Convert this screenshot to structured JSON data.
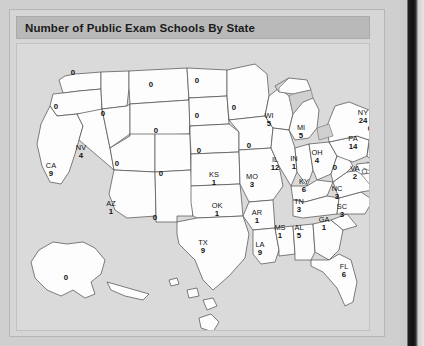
{
  "figure": {
    "title": "Number of Public Exam Schools By State",
    "panel_background": "#dadada",
    "title_bar_background": "#b9b9b9",
    "state_fill": "#fdfdfd",
    "state_border": "#4a4a4a",
    "water_fill": "#d0d0d0"
  },
  "chart_data": {
    "type": "map",
    "title": "Number of Public Exam Schools By State",
    "subtitle": "",
    "xlabel": "",
    "ylabel": "",
    "region_type": "us-states",
    "value_label": "Number of Public Exam Schools",
    "legend": "none",
    "categories": [
      "WA",
      "OR",
      "CA",
      "NV",
      "ID",
      "MT",
      "WY",
      "UT",
      "AZ",
      "CO",
      "NM",
      "ND",
      "SD",
      "NE",
      "KS",
      "OK",
      "TX",
      "MN",
      "IA",
      "MO",
      "AR",
      "LA",
      "WI",
      "IL",
      "MS",
      "AL",
      "MI",
      "IN",
      "OH",
      "KY",
      "TN",
      "GA",
      "FL",
      "SC",
      "NC",
      "VA",
      "WV",
      "PA",
      "NY",
      "ME",
      "VT",
      "NH",
      "MA",
      "RI",
      "CT",
      "NJ",
      "DE",
      "MD",
      "DC",
      "AK",
      "HI"
    ],
    "values": [
      0,
      0,
      9,
      4,
      0,
      0,
      0,
      0,
      1,
      0,
      0,
      0,
      0,
      0,
      1,
      1,
      9,
      0,
      0,
      3,
      1,
      9,
      5,
      12,
      1,
      5,
      5,
      1,
      4,
      6,
      3,
      1,
      6,
      3,
      3,
      2,
      0,
      14,
      24,
      1,
      0,
      0,
      4,
      1,
      0,
      16,
      1,
      5,
      4,
      0,
      0
    ],
    "states": [
      {
        "code": "WA",
        "value": "0",
        "show_code": false,
        "x": 62,
        "y": 63
      },
      {
        "code": "OR",
        "value": "0",
        "show_code": false,
        "x": 45,
        "y": 97
      },
      {
        "code": "CA",
        "value": "9",
        "show_code": true,
        "x": 40,
        "y": 160
      },
      {
        "code": "NV",
        "value": "4",
        "show_code": true,
        "x": 70,
        "y": 142
      },
      {
        "code": "ID",
        "value": "0",
        "show_code": false,
        "x": 92,
        "y": 104
      },
      {
        "code": "MT",
        "value": "0",
        "show_code": false,
        "x": 140,
        "y": 75
      },
      {
        "code": "WY",
        "value": "0",
        "show_code": false,
        "x": 145,
        "y": 121
      },
      {
        "code": "UT",
        "value": "0",
        "show_code": false,
        "x": 106,
        "y": 154
      },
      {
        "code": "AZ",
        "value": "1",
        "show_code": true,
        "x": 100,
        "y": 198
      },
      {
        "code": "CO",
        "value": "0",
        "show_code": false,
        "x": 150,
        "y": 164
      },
      {
        "code": "NM",
        "value": "0",
        "show_code": false,
        "x": 144,
        "y": 208
      },
      {
        "code": "ND",
        "value": "0",
        "show_code": false,
        "x": 186,
        "y": 71
      },
      {
        "code": "SD",
        "value": "0",
        "show_code": false,
        "x": 186,
        "y": 106
      },
      {
        "code": "NE",
        "value": "0",
        "show_code": false,
        "x": 188,
        "y": 141
      },
      {
        "code": "KS",
        "value": "1",
        "show_code": true,
        "x": 203,
        "y": 169
      },
      {
        "code": "OK",
        "value": "1",
        "show_code": true,
        "x": 206,
        "y": 200
      },
      {
        "code": "TX",
        "value": "9",
        "show_code": true,
        "x": 192,
        "y": 237
      },
      {
        "code": "MN",
        "value": "0",
        "show_code": false,
        "x": 223,
        "y": 98
      },
      {
        "code": "IA",
        "value": "0",
        "show_code": false,
        "x": 238,
        "y": 136
      },
      {
        "code": "MO",
        "value": "3",
        "show_code": true,
        "x": 241,
        "y": 171
      },
      {
        "code": "AR",
        "value": "1",
        "show_code": true,
        "x": 246,
        "y": 207
      },
      {
        "code": "LA",
        "value": "9",
        "show_code": true,
        "x": 249,
        "y": 239
      },
      {
        "code": "WI",
        "value": "5",
        "show_code": true,
        "x": 258,
        "y": 110
      },
      {
        "code": "IL",
        "value": "12",
        "show_code": true,
        "x": 264,
        "y": 154
      },
      {
        "code": "MS",
        "value": "1",
        "show_code": true,
        "x": 269,
        "y": 222
      },
      {
        "code": "AL",
        "value": "5",
        "show_code": true,
        "x": 288,
        "y": 222
      },
      {
        "code": "MI",
        "value": "5",
        "show_code": true,
        "x": 290,
        "y": 122
      },
      {
        "code": "IN",
        "value": "1",
        "show_code": true,
        "x": 283,
        "y": 153
      },
      {
        "code": "OH",
        "value": "4",
        "show_code": true,
        "x": 306,
        "y": 147
      },
      {
        "code": "KY",
        "value": "6",
        "show_code": true,
        "x": 293,
        "y": 176
      },
      {
        "code": "TN",
        "value": "3",
        "show_code": true,
        "x": 288,
        "y": 196
      },
      {
        "code": "GA",
        "value": "1",
        "show_code": true,
        "x": 313,
        "y": 214
      },
      {
        "code": "FL",
        "value": "6",
        "show_code": true,
        "x": 333,
        "y": 261
      },
      {
        "code": "SC",
        "value": "3",
        "show_code": true,
        "x": 331,
        "y": 201
      },
      {
        "code": "NC",
        "value": "3",
        "show_code": true,
        "x": 326,
        "y": 183
      },
      {
        "code": "VA",
        "value": "2",
        "show_code": true,
        "x": 344,
        "y": 163
      },
      {
        "code": "WV",
        "value": "0",
        "show_code": false,
        "x": 324,
        "y": 158
      },
      {
        "code": "PA",
        "value": "14",
        "show_code": true,
        "x": 342,
        "y": 133
      },
      {
        "code": "NY",
        "value": "24",
        "show_code": true,
        "x": 352,
        "y": 107
      },
      {
        "code": "ME",
        "value": "1",
        "show_code": true,
        "x": 386,
        "y": 72
      },
      {
        "code": "VT",
        "value": "0",
        "show_code": false,
        "x": 364,
        "y": 99
      },
      {
        "code": "NH",
        "value": "0",
        "show_code": false,
        "x": 375,
        "y": 99
      },
      {
        "code": "MA",
        "value": "4",
        "show_code": true,
        "x": 397,
        "y": 103
      },
      {
        "code": "RI",
        "value": "1",
        "show_code": true,
        "x": 391,
        "y": 123
      },
      {
        "code": "CT",
        "value": "0",
        "show_code": false,
        "x": 359,
        "y": 119
      },
      {
        "code": "NJ",
        "value": "16",
        "show_code": true,
        "x": 385,
        "y": 134
      },
      {
        "code": "DE",
        "value": "1",
        "show_code": true,
        "x": 380,
        "y": 150
      },
      {
        "code": "MD",
        "value": "5",
        "show_code": true,
        "x": 388,
        "y": 166
      },
      {
        "code": "DC",
        "value": "4",
        "show_code": true,
        "x": 366,
        "y": 172
      },
      {
        "code": "AK",
        "value": "0",
        "show_code": false,
        "x": 55,
        "y": 268
      },
      {
        "code": "HI",
        "value": "0",
        "show_code": false,
        "x": 194,
        "y": 323
      }
    ]
  }
}
